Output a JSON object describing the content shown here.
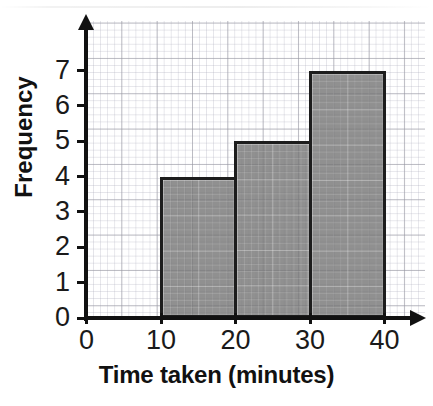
{
  "chart_data": {
    "type": "bar",
    "title": "",
    "xlabel": "Time taken (minutes)",
    "ylabel": "Frequency",
    "categories": [
      "10-20",
      "20-30",
      "30-40"
    ],
    "values": [
      4,
      5,
      7
    ],
    "bin_edges": [
      10,
      20,
      30,
      40
    ],
    "x_ticks": [
      "0",
      "10",
      "20",
      "30",
      "40"
    ],
    "x_tick_values": [
      0,
      10,
      20,
      30,
      40
    ],
    "y_ticks": [
      "0",
      "1",
      "2",
      "3",
      "4",
      "5",
      "6",
      "7"
    ],
    "y_tick_values": [
      0,
      1,
      2,
      3,
      4,
      5,
      6,
      7
    ],
    "xlim": [
      0,
      40
    ],
    "ylim": [
      0,
      7
    ],
    "grid": true,
    "grid_style": "graph-paper, minor squares with major line every 5",
    "legend": "none",
    "bar_fill_color": "#787878",
    "bar_border_color": "#1d1d1d",
    "axis_color": "#111111",
    "background_color": "#ffffff"
  },
  "axis": {
    "x_title": "Time taken (minutes)",
    "y_title": "Frequency"
  },
  "icons": {
    "y_axis_arrow": "arrow-up-icon",
    "x_axis_arrow": "arrow-right-icon"
  }
}
